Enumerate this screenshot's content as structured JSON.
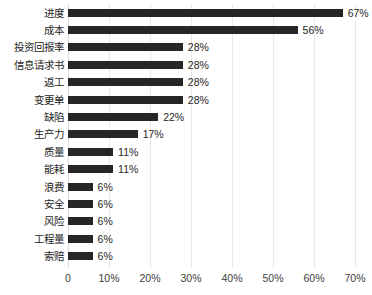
{
  "chart_data": {
    "type": "bar",
    "orientation": "horizontal",
    "title": "",
    "subtitle": "",
    "xlabel": "",
    "ylabel": "",
    "xlim": [
      0,
      70
    ],
    "grid": true,
    "legend": false,
    "bar_color": "#262626",
    "gridline_color": "#e8e8e8",
    "background": "#ffffff",
    "xticks": [
      0,
      10,
      20,
      30,
      40,
      50,
      60,
      70
    ],
    "xtick_labels": [
      "0",
      "10%",
      "20%",
      "30%",
      "40%",
      "50%",
      "60%",
      "70%"
    ],
    "categories": [
      "进度",
      "成本",
      "投资回报率",
      "信息请求书",
      "返工",
      "变更单",
      "缺陷",
      "生产力",
      "质量",
      "能耗",
      "浪费",
      "安全",
      "风险",
      "工程量",
      "索赔"
    ],
    "values": [
      67,
      56,
      28,
      28,
      28,
      28,
      22,
      17,
      11,
      11,
      6,
      6,
      6,
      6,
      6
    ],
    "value_labels": [
      "67%",
      "56%",
      "28%",
      "28%",
      "28%",
      "28%",
      "22%",
      "17%",
      "11%",
      "11%",
      "6%",
      "6%",
      "6%",
      "6%",
      "6%"
    ]
  }
}
